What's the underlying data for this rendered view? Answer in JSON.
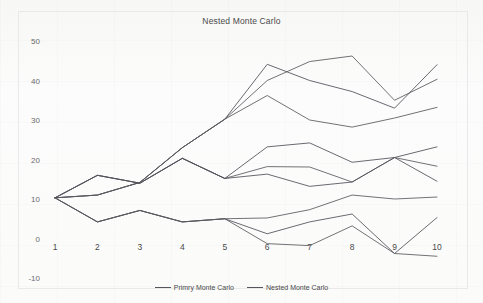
{
  "chart_data": {
    "type": "line",
    "title": "Nested Monte Carlo",
    "xlabel": "",
    "ylabel": "",
    "categories": [
      1,
      2,
      3,
      4,
      5,
      6,
      7,
      8,
      9,
      10
    ],
    "x": [
      1,
      2,
      3,
      4,
      5,
      6,
      7,
      8,
      9,
      10
    ],
    "xticklabels": [
      "1",
      "2",
      "3",
      "4",
      "5",
      "6",
      "7",
      "8",
      "9",
      "10"
    ],
    "yticklabels": [
      "50",
      "40",
      "30",
      "20",
      "10",
      "0",
      "-10"
    ],
    "yticks": [
      50,
      40,
      30,
      20,
      10,
      0,
      -10
    ],
    "ylim": [
      -10,
      50
    ],
    "xlim": [
      1,
      10
    ],
    "grid": false,
    "legend_position": "bottom",
    "legend": [
      "Primry Monte Carlo",
      "Nested Monte Carlo"
    ],
    "series": [
      {
        "name": "Primry Monte Carlo",
        "group": "primary",
        "values": [
          10.3,
          11.0,
          14.2,
          23.0,
          30.2,
          40.0,
          44.8,
          46.2,
          35.0,
          40.3
        ]
      },
      {
        "name": "Nested Monte Carlo",
        "group": "nested",
        "values": [
          10.3,
          11.0,
          14.2,
          23.0,
          30.2,
          44.1,
          40.0,
          37.2,
          33.0,
          44.0
        ]
      },
      {
        "name": "Primry Monte Carlo",
        "group": "primary",
        "values": [
          10.3,
          11.0,
          14.2,
          23.0,
          30.2,
          36.2,
          30.0,
          28.2,
          30.5,
          33.2
        ]
      },
      {
        "name": "Nested Monte Carlo",
        "group": "nested",
        "values": [
          10.3,
          16.0,
          14.0,
          20.3,
          15.2,
          23.2,
          24.2,
          19.3,
          20.5,
          23.2
        ]
      },
      {
        "name": "Primry Monte Carlo",
        "group": "primary",
        "values": [
          10.3,
          16.0,
          14.0,
          20.3,
          15.2,
          18.2,
          18.1,
          14.3,
          20.5,
          18.3
        ]
      },
      {
        "name": "Nested Monte Carlo",
        "group": "nested",
        "values": [
          10.3,
          16.0,
          14.0,
          20.3,
          15.2,
          16.3,
          13.2,
          14.3,
          20.5,
          14.5
        ]
      },
      {
        "name": "Primry Monte Carlo",
        "group": "primary",
        "values": [
          10.3,
          4.2,
          7.1,
          4.2,
          5.0,
          5.2,
          7.3,
          11.0,
          10.0,
          10.5
        ]
      },
      {
        "name": "Nested Monte Carlo",
        "group": "nested",
        "values": [
          10.3,
          4.2,
          7.1,
          4.2,
          5.0,
          1.2,
          4.2,
          6.2,
          -3.8,
          5.3
        ]
      },
      {
        "name": "Primry Monte Carlo",
        "group": "primary",
        "values": [
          10.3,
          4.2,
          7.1,
          4.2,
          5.0,
          -1.3,
          -1.8,
          3.2,
          -3.8,
          -4.5
        ]
      }
    ]
  },
  "legend": {
    "items": [
      {
        "label": "Primry Monte Carlo",
        "color": "#55555c"
      },
      {
        "label": "Nested Monte Carlo",
        "color": "#55555c"
      }
    ]
  },
  "colors": {
    "line": "#59595f",
    "title": "#4a4a4a",
    "tick": "#6b6b6b",
    "frame": "#e9e9e9",
    "background": "#fdfdfd"
  }
}
